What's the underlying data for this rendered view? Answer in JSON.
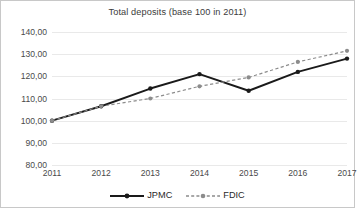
{
  "chart_data": {
    "type": "line",
    "title": "Total deposits (base 100 in 2011)",
    "xlabel": "",
    "ylabel": "",
    "categories": [
      "2011",
      "2012",
      "2013",
      "2014",
      "2015",
      "2016",
      "2017"
    ],
    "series": [
      {
        "name": "JPMC",
        "values": [
          100.0,
          106.5,
          114.5,
          121.0,
          113.5,
          122.0,
          128.0
        ],
        "color": "#1a1a1a",
        "style": "solid",
        "marker": "circle"
      },
      {
        "name": "FDIC",
        "values": [
          100.0,
          106.5,
          110.0,
          115.5,
          119.5,
          126.5,
          131.5
        ],
        "color": "#808080",
        "style": "dashed",
        "marker": "circle"
      }
    ],
    "ylim": [
      80,
      140
    ],
    "yticks": [
      140,
      130,
      120,
      110,
      100,
      90,
      80
    ],
    "ytick_labels": [
      "140,00",
      "130,00",
      "120,00",
      "110,00",
      "100,00",
      "90,00",
      "80,00"
    ],
    "grid": true,
    "legend_position": "bottom"
  },
  "legend": {
    "jpmc_label": "JPMC",
    "fdic_label": "FDIC"
  },
  "colors": {
    "jpmc": "#1a1a1a",
    "fdic": "#808080",
    "gridline": "#e9e9e9",
    "border": "#c8c8c8",
    "text": "#4a4a4a"
  }
}
